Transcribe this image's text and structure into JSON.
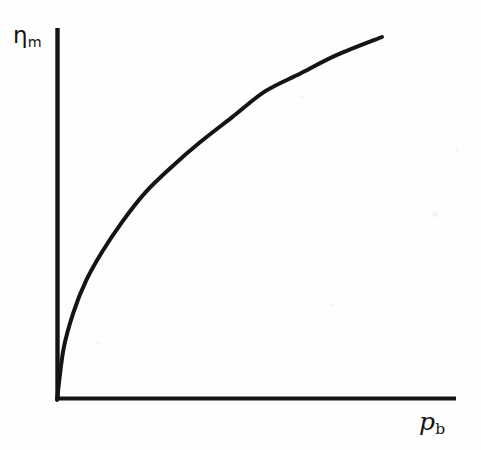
{
  "figure": {
    "background_color": "#fefefe",
    "ink_color": "#141414"
  },
  "labels": {
    "y_symbol": "η",
    "y_subscript": "m",
    "x_symbol": "p",
    "x_subscript": "b"
  },
  "chart_data": {
    "type": "line",
    "title": "",
    "subtitle": "",
    "xlabel": "p_b",
    "ylabel": "η_m",
    "grid": false,
    "legend": null,
    "tick_labels": {
      "x": [],
      "y": []
    },
    "axis_style": "open-corner (only left and bottom spines, no ticks, no numbers)",
    "annotations": [],
    "xlim": [
      0,
      1
    ],
    "ylim": [
      0,
      1
    ],
    "series": [
      {
        "name": "eta_m vs p_b",
        "x": [
          0.0,
          0.02,
          0.05,
          0.09,
          0.14,
          0.2,
          0.27,
          0.35,
          0.44,
          0.54,
          0.64,
          0.75,
          0.86,
          1.0
        ],
        "y": [
          0.0,
          0.14,
          0.24,
          0.33,
          0.41,
          0.49,
          0.57,
          0.64,
          0.71,
          0.78,
          0.85,
          0.9,
          0.95,
          1.0
        ]
      }
    ]
  },
  "geometry": {
    "origin_px": [
      57,
      400
    ],
    "y_axis_top_px": [
      57,
      28
    ],
    "x_axis_right_px": [
      456,
      400
    ],
    "curve_end_px": [
      382,
      37
    ],
    "line_width_px": 4
  }
}
